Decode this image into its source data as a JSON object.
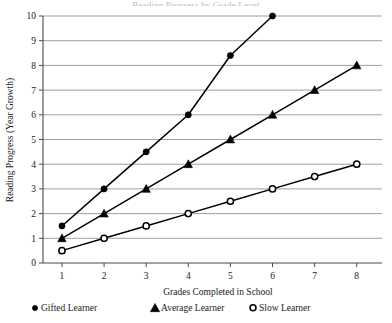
{
  "figure": {
    "title_clipped": "Reading Progress by Grade Level"
  },
  "chart_data": {
    "type": "line",
    "title": "",
    "xlabel": "Grades Completed in School",
    "ylabel": "Reading Progress (Year Growth)",
    "x": [
      1,
      2,
      3,
      4,
      5,
      6,
      7,
      8
    ],
    "xlim": [
      0.55,
      8.6
    ],
    "ylim": [
      0,
      10
    ],
    "xticks": [
      "1",
      "2",
      "3",
      "4",
      "5",
      "6",
      "7",
      "8"
    ],
    "yticks": [
      "0",
      "1",
      "2",
      "3",
      "4",
      "5",
      "6",
      "7",
      "8",
      "9",
      "10"
    ],
    "grid": "horizontal",
    "legend_position": "below-axis",
    "series": [
      {
        "name": "Gifted Learner",
        "marker": "filled-circle",
        "x": [
          1,
          2,
          3,
          4,
          5,
          6
        ],
        "values": [
          1.5,
          3,
          4.5,
          6,
          8.4,
          10
        ]
      },
      {
        "name": "Average Learner",
        "marker": "filled-triangle",
        "x": [
          1,
          2,
          3,
          4,
          5,
          6,
          7,
          8
        ],
        "values": [
          1,
          2,
          3,
          4,
          5,
          6,
          7,
          8
        ]
      },
      {
        "name": "Slow Learner",
        "marker": "open-circle",
        "x": [
          1,
          2,
          3,
          4,
          5,
          6,
          7,
          8
        ],
        "values": [
          0.5,
          1,
          1.5,
          2,
          2.5,
          3,
          3.5,
          4
        ]
      }
    ]
  },
  "legend": {
    "items": [
      {
        "label": "Gifted Learner",
        "marker": "filled-circle"
      },
      {
        "label": "Average Learner",
        "marker": "filled-triangle"
      },
      {
        "label": "Slow Learner",
        "marker": "open-circle"
      }
    ]
  },
  "colors": {
    "ink": "#000000",
    "grid": "#8e8e92",
    "axis": "#4a4a4a",
    "background": "#ffffff"
  }
}
